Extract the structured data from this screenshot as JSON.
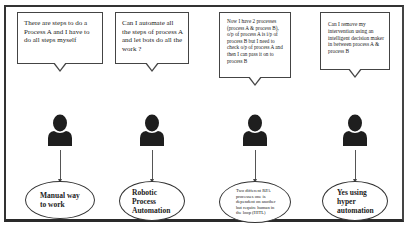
{
  "diagram": {
    "type": "process-evolution",
    "columns": [
      {
        "question": "There are steps to do a Process A and I have to do all steps myself",
        "actor": "user",
        "outcome": "Manual way to work"
      },
      {
        "question": "Can I automate all the steps of process A and let bots do all the work ?",
        "actor": "user",
        "outcome": "Robotic Process Automation"
      },
      {
        "question": "Now I have 2 processes (process A & process B), o/p of process A is i/p of process B but I need to check o/p of process A and then I can pass it on to process B",
        "actor": "user",
        "outcome": "Two different RPA processes one is dependent on another but require human in the loop (HITL)"
      },
      {
        "question": "Can I remove my intervention using an intelligent decision maker in between process A & process B",
        "actor": "user",
        "outcome": "Yes using hyper automation"
      }
    ]
  },
  "colors": {
    "border": "#333333",
    "icon": "#1e1e1e",
    "background": "#ffffff"
  }
}
